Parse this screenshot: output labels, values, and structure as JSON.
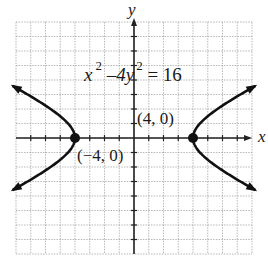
{
  "chart_data": {
    "type": "line",
    "title": "",
    "equation": "x^2 - 4y^2 = 16",
    "equation_parts": {
      "x": "x",
      "exp1": "2",
      "minus": "–",
      "coef_y": "4y",
      "exp2": "2",
      "rhs": "= 16"
    },
    "xlabel": "x",
    "ylabel": "y",
    "xlim": [
      -8,
      8
    ],
    "ylim": [
      -8,
      8
    ],
    "grid": true,
    "grid_spacing": 1,
    "series": [
      {
        "name": "right branch",
        "x": [
          4,
          4.47,
          5,
          6,
          7,
          8
        ],
        "y_upper": [
          0,
          1,
          1.5,
          2.24,
          2.87,
          3.46
        ],
        "y_lower": [
          0,
          -1,
          -1.5,
          -2.24,
          -2.87,
          -3.46
        ]
      },
      {
        "name": "left branch",
        "x": [
          -4,
          -4.47,
          -5,
          -6,
          -7,
          -8
        ],
        "y_upper": [
          0,
          1,
          1.5,
          2.24,
          2.87,
          3.46
        ],
        "y_lower": [
          0,
          -1,
          -1.5,
          -2.24,
          -2.87,
          -3.46
        ]
      }
    ],
    "points": [
      {
        "label": "(4, 0)",
        "x": 4,
        "y": 0
      },
      {
        "label": "(−4, 0)",
        "x": -4,
        "y": 0
      }
    ]
  },
  "labels": {
    "y_axis": "y",
    "x_axis": "x",
    "vertex_right": "(4, 0)",
    "vertex_left": "(−4, 0)"
  },
  "colors": {
    "curve": "#111111",
    "axis": "#222222",
    "grid": "#9a9a9a"
  }
}
